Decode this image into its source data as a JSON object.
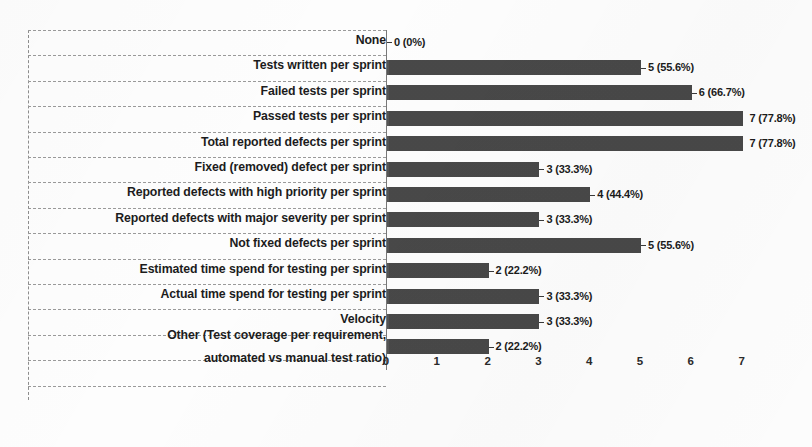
{
  "chart_data": {
    "type": "bar",
    "orientation": "horizontal",
    "title": "",
    "xlabel": "",
    "ylabel": "",
    "xlim": [
      0,
      7
    ],
    "xticks": [
      "0",
      "1",
      "2",
      "3",
      "4",
      "5",
      "6",
      "7"
    ],
    "grid": true,
    "legend": "none",
    "total_respondents": 9,
    "bar_color": "#4c4c4c",
    "categories": [
      "None",
      "Tests written per sprint",
      "Failed tests per sprint",
      "Passed tests per sprint",
      "Total reported defects per sprint",
      "Fixed (removed) defect per sprint",
      "Reported defects with high priority per sprint",
      "Reported defects with major severity per sprint",
      "Not fixed defects per sprint",
      "Estimated time spend for testing per sprint",
      "Actual time spend for testing per sprint",
      "Velocity",
      "Other (Test coverage per requirement, automated vs manual test ratio)"
    ],
    "values": [
      0,
      5,
      6,
      7,
      7,
      3,
      4,
      3,
      5,
      2,
      3,
      3,
      2
    ],
    "percents": [
      "0%",
      "55.6%",
      "66.7%",
      "77.8%",
      "77.8%",
      "33.3%",
      "44.4%",
      "33.3%",
      "55.6%",
      "22.2%",
      "33.3%",
      "33.3%",
      "22.2%"
    ],
    "data_labels": [
      "0 (0%)",
      "5 (55.6%)",
      "6 (66.7%)",
      "7 (77.8%)",
      "7 (77.8%)",
      "3 (33.3%)",
      "4 (44.4%)",
      "3 (33.3%)",
      "5 (55.6%)",
      "2 (22.2%)",
      "3 (33.3%)",
      "3 (33.3%)",
      "2 (22.2%)"
    ],
    "category_lines": [
      [
        "None"
      ],
      [
        "Tests written per sprint"
      ],
      [
        "Failed tests per sprint"
      ],
      [
        "Passed tests per sprint"
      ],
      [
        "Total reported defects per sprint"
      ],
      [
        "Fixed (removed) defect per sprint"
      ],
      [
        "Reported defects with high priority per sprint"
      ],
      [
        "Reported defects with major severity per sprint"
      ],
      [
        "Not fixed defects per sprint"
      ],
      [
        "Estimated time spend for testing per sprint"
      ],
      [
        "Actual time spend for testing per sprint"
      ],
      [
        "Velocity"
      ],
      [
        "Other (Test coverage per requirement,",
        "automated vs manual test ratio)"
      ]
    ]
  }
}
